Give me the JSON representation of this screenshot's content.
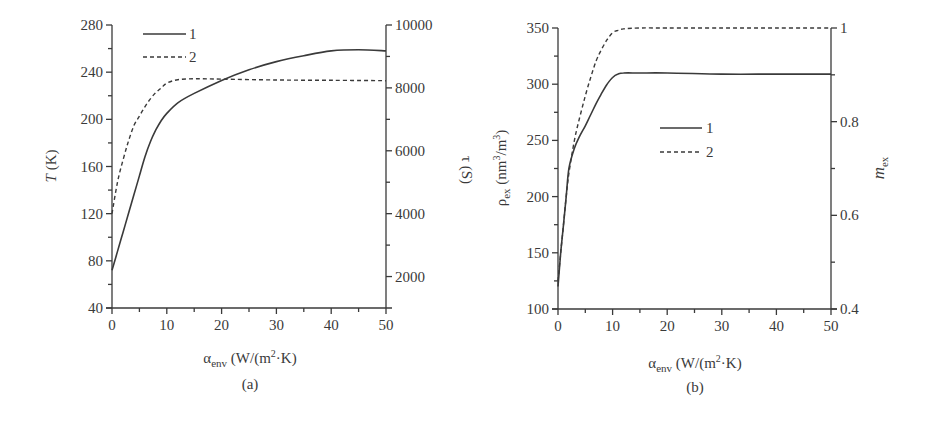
{
  "chart_data": [
    {
      "panel": "(a)",
      "type": "line",
      "title": "",
      "xlabel": "α_env (W/(m²·K)",
      "ylabel": "T (K)",
      "y2label": "τ (S)",
      "xlim": [
        0,
        50
      ],
      "ylim": [
        40,
        280
      ],
      "y2lim": [
        1000,
        10000
      ],
      "xticks": [
        0,
        10,
        20,
        30,
        40,
        50
      ],
      "yticks": [
        40,
        80,
        120,
        160,
        200,
        240,
        280
      ],
      "y2ticks": [
        2000,
        4000,
        6000,
        8000,
        10000
      ],
      "grid": false,
      "legend_position": "upper left",
      "series": [
        {
          "name": "1",
          "axis": "left",
          "style": "solid",
          "x": [
            0,
            1,
            2,
            3,
            4,
            5,
            6,
            7,
            8,
            9,
            10,
            12,
            15,
            20,
            25,
            30,
            35,
            40,
            45,
            50
          ],
          "values": [
            72,
            88,
            104,
            120,
            136,
            152,
            168,
            181,
            191,
            199,
            205,
            214,
            222,
            233,
            242,
            249,
            254,
            258,
            259,
            258
          ]
        },
        {
          "name": "2",
          "axis": "right",
          "style": "dashed",
          "x": [
            0,
            1,
            2,
            3,
            4,
            5,
            6,
            7,
            8,
            9,
            10,
            12,
            15,
            20,
            30,
            40,
            50
          ],
          "values": [
            4000,
            5000,
            5700,
            6300,
            6800,
            7100,
            7400,
            7650,
            7850,
            8000,
            8150,
            8260,
            8290,
            8280,
            8250,
            8240,
            8230
          ]
        }
      ]
    },
    {
      "panel": "(b)",
      "type": "line",
      "title": "",
      "xlabel": "α_env (W/(m²·K)",
      "ylabel": "ρ_ex (nm³/m³)",
      "y2label": "m_ex",
      "xlim": [
        0,
        50
      ],
      "ylim": [
        100,
        350
      ],
      "y2lim": [
        0.4,
        1.0
      ],
      "xticks": [
        0,
        10,
        20,
        30,
        40,
        50
      ],
      "yticks": [
        100,
        150,
        200,
        250,
        300,
        350
      ],
      "y2ticks": [
        0.4,
        0.6,
        0.8,
        1
      ],
      "grid": false,
      "legend_position": "center",
      "series": [
        {
          "name": "1",
          "axis": "left",
          "style": "solid",
          "x": [
            0,
            0.5,
            1,
            1.5,
            2,
            3,
            4,
            5,
            6,
            7,
            8,
            9,
            10,
            11,
            12,
            15,
            20,
            30,
            40,
            50
          ],
          "values": [
            120,
            150,
            175,
            200,
            225,
            243,
            254,
            263,
            273,
            283,
            292,
            300,
            306,
            309,
            310,
            310,
            310,
            309,
            309,
            309
          ]
        },
        {
          "name": "2",
          "axis": "right",
          "style": "dashed",
          "x": [
            0,
            0.5,
            1,
            1.5,
            2,
            3,
            4,
            5,
            6,
            7,
            8,
            9,
            10,
            11,
            12,
            15,
            20,
            30,
            40,
            50
          ],
          "values": [
            0.46,
            0.52,
            0.58,
            0.64,
            0.69,
            0.76,
            0.81,
            0.855,
            0.895,
            0.93,
            0.955,
            0.975,
            0.99,
            0.995,
            0.998,
            1.0,
            1.0,
            1.0,
            1.0,
            1.0
          ]
        }
      ]
    }
  ],
  "panels": {
    "a": {
      "caption": "(a)",
      "ylabel_italic": "T",
      "ylabel_unit": " (K)",
      "y2label": "τ (S)",
      "xlabel_main": "α",
      "xlabel_sub": "env",
      "xlabel_unit": " (W/(m",
      "xlabel_sup": "2",
      "xlabel_tail": "·K)",
      "legend": [
        "1",
        "2"
      ],
      "xticks": [
        "0",
        "10",
        "20",
        "30",
        "40",
        "50"
      ],
      "yticks": [
        "40",
        "80",
        "120",
        "160",
        "200",
        "240",
        "280"
      ],
      "y2ticks": [
        "2000",
        "4000",
        "6000",
        "8000",
        "10000"
      ]
    },
    "b": {
      "caption": "(b)",
      "ylabel_main": "ρ",
      "ylabel_sub": "ex",
      "ylabel_unit": " (nm",
      "ylabel_sup1": "3",
      "ylabel_mid": "/m",
      "ylabel_sup2": "3",
      "ylabel_tail": ")",
      "y2label_main": "m",
      "y2label_sub": "ex",
      "xlabel_main": "α",
      "xlabel_sub": "env",
      "xlabel_unit": " (W/(m",
      "xlabel_sup": "2",
      "xlabel_tail": "·K)",
      "legend": [
        "1",
        "2"
      ],
      "xticks": [
        "0",
        "10",
        "20",
        "30",
        "40",
        "50"
      ],
      "yticks": [
        "100",
        "150",
        "200",
        "250",
        "300",
        "350"
      ],
      "y2ticks": [
        "0.4",
        "0.6",
        "0.8",
        "1"
      ]
    }
  },
  "colors": {
    "ink": "#3a3a3a",
    "background": "#ffffff"
  }
}
